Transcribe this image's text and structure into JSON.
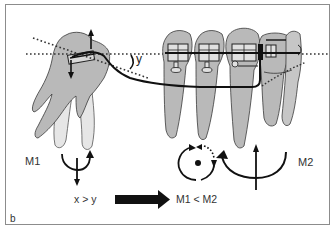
{
  "figure": {
    "panel_label": "b",
    "angle_label": "y",
    "moment_labels": {
      "m1": "M1",
      "m2": "M2"
    },
    "comparison": "x > y",
    "result": "M1 < M2",
    "colors": {
      "tooth_fill": "#b9b9b9",
      "root_light": "#e6e6e6",
      "outline": "#3a3a3a",
      "wire": "#111111",
      "frame": "#8c8c8c"
    },
    "icons": {
      "m1_symbol": "tipping-moment-small-icon",
      "m2_symbol": "tipping-moment-large-icon",
      "rotation_symbol": "center-of-rotation-icon",
      "arrow": "thick-right-arrow-icon"
    }
  }
}
